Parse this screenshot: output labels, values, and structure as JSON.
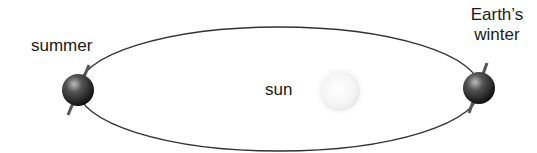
{
  "diagram": {
    "labels": {
      "summer": "summer",
      "winter_line1": "Earth’s",
      "winter_line2": "winter",
      "sun": "sun"
    },
    "colors": {
      "orbit": "#333333",
      "earth": "#1e1e1e",
      "sun": "#f2f2f2",
      "text": "#1a1a1a"
    }
  }
}
